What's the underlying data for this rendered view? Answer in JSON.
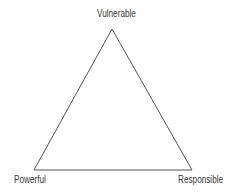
{
  "diagram": {
    "type": "triangle",
    "vertices": {
      "top": {
        "label": "Vulnerable",
        "x": 112,
        "y": 29
      },
      "bottom_left": {
        "label": "Powerful",
        "x": 34,
        "y": 170
      },
      "bottom_right": {
        "label": "Responsible",
        "x": 192,
        "y": 170
      }
    },
    "stroke_color": "#555555",
    "background": "#ffffff"
  }
}
